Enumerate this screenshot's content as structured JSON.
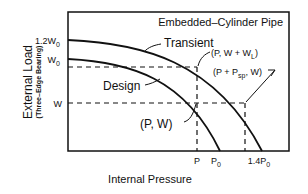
{
  "title": "Embedded–Cylinder Pipe",
  "axes": {
    "ylabel": "External Load",
    "ylabel_sub": "(Three–Edge Bearing)",
    "xlabel": "Internal Pressure"
  },
  "y_ticks": {
    "t1": "1.2W",
    "t1_sub": "0",
    "t2": "W",
    "t2_sub": "0",
    "t3": "W"
  },
  "x_ticks": {
    "t1": "P",
    "t2": "P",
    "t2_sub": "0",
    "t3": "1.4P",
    "t3_sub": "0"
  },
  "curves": {
    "transient": "Transient",
    "design": "Design"
  },
  "points": {
    "pw": "(P, W)",
    "pwwl_a": "(P, W + W",
    "pwwl_sub": "L",
    "pwwl_b": ")",
    "ppsp_a": "(P + P",
    "ppsp_sub": "sp",
    "ppsp_b": ", W)"
  },
  "colors": {
    "ink": "#111111",
    "background": "#ffffff"
  }
}
